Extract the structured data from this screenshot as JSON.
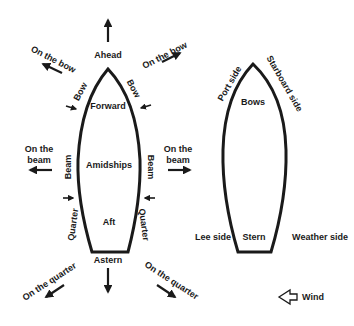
{
  "diagram": {
    "ink_color": "#1a1a1a",
    "left_boat": {
      "inside_labels": {
        "forward": "Forward",
        "amidships": "Amidships",
        "aft": "Aft"
      },
      "hull_labels": {
        "bow_left": "Bow",
        "bow_right": "Bow",
        "beam_left": "Beam",
        "beam_right": "Beam",
        "quarter_left": "Quarter",
        "quarter_right": "Quarter"
      },
      "directions": {
        "ahead": "Ahead",
        "astern": "Astern",
        "on_the_bow_left": "On the bow",
        "on_the_bow_right": "On the bow",
        "on_the_beam_left_line1": "On the",
        "on_the_beam_left_line2": "beam",
        "on_the_beam_right_line1": "On the",
        "on_the_beam_right_line2": "beam",
        "on_the_quarter_left": "On the quarter",
        "on_the_quarter_right": "On the quarter"
      }
    },
    "right_boat": {
      "inside_labels": {
        "bows": "Bows",
        "stern": "Stern"
      },
      "side_labels": {
        "port_side": "Port side",
        "starboard_side": "Starboard side",
        "lee_side": "Lee side",
        "weather_side": "Weather side"
      }
    },
    "legend": {
      "wind": "Wind",
      "wind_icon": "hollow-arrow-left"
    }
  }
}
